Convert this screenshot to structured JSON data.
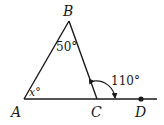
{
  "diagram": {
    "points": {
      "A": {
        "label": "A",
        "x": 24,
        "y": 99
      },
      "B": {
        "label": "B",
        "x": 69,
        "y": 21
      },
      "C": {
        "label": "C",
        "x": 97,
        "y": 99
      },
      "D": {
        "label": "D",
        "x": 141,
        "y": 99
      }
    },
    "angles": {
      "at_A": "x°",
      "at_B": "50°",
      "exterior_C": "110°"
    },
    "colors": {
      "stroke": "#1a1a1a",
      "background": "#ffffff"
    }
  }
}
